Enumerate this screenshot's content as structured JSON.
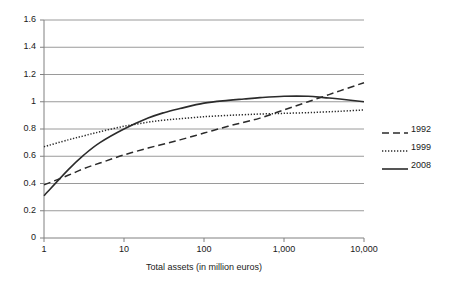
{
  "chart_data": {
    "type": "line",
    "title": "",
    "subtitle": "",
    "xlabel": "Total assets (in million euros)",
    "ylabel": "",
    "xscale": "log",
    "xlim": [
      1,
      10000
    ],
    "ylim": [
      0,
      1.6
    ],
    "grid": "horizontal",
    "legend_position": "right",
    "xticks": [
      1,
      10,
      100,
      1000,
      10000
    ],
    "xticklabels": [
      "1",
      "10",
      "100",
      "1,000",
      "10,000"
    ],
    "yticks": [
      0,
      0.2,
      0.4,
      0.6,
      0.8,
      1,
      1.2,
      1.4,
      1.6
    ],
    "yticklabels": [
      "0",
      "0.2",
      "0.4",
      "0.6",
      "0.8",
      "1",
      "1.2",
      "1.4",
      "1.6"
    ],
    "x": [
      1,
      2,
      3.16,
      5,
      10,
      20,
      31.6,
      50,
      100,
      200,
      316,
      500,
      1000,
      2000,
      3160,
      5000,
      10000
    ],
    "series": [
      {
        "name": "1992",
        "style": "dashed",
        "color": "#2b2b2b",
        "values": [
          0.39,
          0.46,
          0.51,
          0.55,
          0.61,
          0.66,
          0.69,
          0.72,
          0.77,
          0.82,
          0.85,
          0.88,
          0.94,
          1.0,
          1.04,
          1.08,
          1.14
        ]
      },
      {
        "name": "1999",
        "style": "dotted",
        "color": "#2b2b2b",
        "values": [
          0.67,
          0.72,
          0.75,
          0.78,
          0.82,
          0.85,
          0.865,
          0.875,
          0.89,
          0.9,
          0.905,
          0.91,
          0.915,
          0.92,
          0.925,
          0.93,
          0.94
        ]
      },
      {
        "name": "2008",
        "style": "solid",
        "color": "#2b2b2b",
        "values": [
          0.31,
          0.5,
          0.61,
          0.7,
          0.8,
          0.88,
          0.92,
          0.95,
          0.99,
          1.01,
          1.02,
          1.03,
          1.04,
          1.04,
          1.03,
          1.02,
          1.0
        ]
      }
    ],
    "legend": [
      {
        "label": "1992",
        "style": "dashed"
      },
      {
        "label": "1999",
        "style": "dotted"
      },
      {
        "label": "2008",
        "style": "solid"
      }
    ],
    "axis_color": "#808080",
    "grid_color": "#9a9a9a"
  }
}
